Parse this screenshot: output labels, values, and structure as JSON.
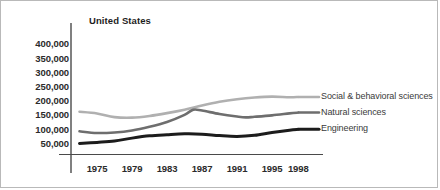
{
  "chart_title": "United States",
  "chart_data": {
    "type": "line",
    "title": "United States",
    "xlabel": "",
    "ylabel": "",
    "grid": false,
    "legend_position": "right-inline",
    "xlim": [
      1973,
      1999
    ],
    "ylim": [
      0,
      400000
    ],
    "x_ticks": [
      "1975",
      "1979",
      "1983",
      "1987",
      "1991",
      "1995",
      "1998"
    ],
    "x_tick_values": [
      1975,
      1979,
      1983,
      1987,
      1991,
      1995,
      1998
    ],
    "y_ticks": [
      "50,000",
      "100,000",
      "150,000",
      "200,000",
      "250,000",
      "300,000",
      "350,000",
      "400,000"
    ],
    "y_tick_values": [
      50000,
      100000,
      150000,
      200000,
      250000,
      300000,
      350000,
      400000
    ],
    "series": [
      {
        "name": "Social & behavioral sciences",
        "color": "#b0b0b0",
        "width": 2.6,
        "x": [
          1973,
          1975,
          1977,
          1979,
          1981,
          1983,
          1985,
          1987,
          1989,
          1991,
          1993,
          1995,
          1997,
          1998
        ],
        "values": [
          163000,
          157000,
          144000,
          142000,
          148000,
          158000,
          170000,
          185000,
          198000,
          207000,
          213000,
          216000,
          214000,
          215000
        ]
      },
      {
        "name": "Natural sciences",
        "color": "#6e6e6e",
        "width": 2.6,
        "x": [
          1973,
          1975,
          1977,
          1979,
          1981,
          1983,
          1985,
          1986,
          1987,
          1989,
          1991,
          1992,
          1993,
          1995,
          1997,
          1998
        ],
        "values": [
          94000,
          88000,
          90000,
          97000,
          110000,
          127000,
          152000,
          170000,
          167000,
          155000,
          146000,
          143000,
          145000,
          150000,
          157000,
          160000
        ]
      },
      {
        "name": "Engineering",
        "color": "#1c1c1c",
        "width": 3.0,
        "x": [
          1973,
          1975,
          1977,
          1979,
          1981,
          1983,
          1985,
          1987,
          1989,
          1991,
          1993,
          1995,
          1997,
          1998
        ],
        "values": [
          51000,
          55000,
          60000,
          70000,
          78000,
          82000,
          85000,
          84000,
          79000,
          76000,
          80000,
          90000,
          98000,
          101000
        ]
      }
    ]
  },
  "legend": [
    {
      "label": "Social & behavioral sciences"
    },
    {
      "label": "Natural sciences"
    },
    {
      "label": "Engineering"
    }
  ],
  "axis": {
    "x_tick_labels": [
      "1975",
      "1979",
      "1983",
      "1987",
      "1991",
      "1995",
      "1998"
    ],
    "y_tick_labels": [
      "400,000",
      "350,000",
      "300,000",
      "250,000",
      "200,000",
      "150,000",
      "100,000",
      "50,000"
    ]
  }
}
